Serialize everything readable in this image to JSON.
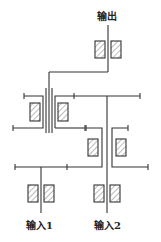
{
  "diagram": {
    "type": "gear-train-schematic",
    "labels": {
      "output": "输出",
      "input1": "输入1",
      "input2": "输入2"
    },
    "colors": {
      "line": "#333333",
      "hatch": "#555555",
      "background": "#ffffff"
    },
    "components": [
      {
        "name": "output-shaft",
        "kind": "shaft"
      },
      {
        "name": "output-bearing-pair",
        "kind": "bearing-pair"
      },
      {
        "name": "upper-left-gear-set",
        "kind": "gear"
      },
      {
        "name": "upper-right-gear",
        "kind": "gear"
      },
      {
        "name": "middle-right-gear-set",
        "kind": "gear"
      },
      {
        "name": "lower-left-gear",
        "kind": "gear"
      },
      {
        "name": "input1-shaft",
        "kind": "shaft"
      },
      {
        "name": "input1-bearing-pair",
        "kind": "bearing-pair"
      },
      {
        "name": "input2-shaft",
        "kind": "shaft"
      },
      {
        "name": "input2-bearing-pair",
        "kind": "bearing-pair"
      }
    ]
  }
}
